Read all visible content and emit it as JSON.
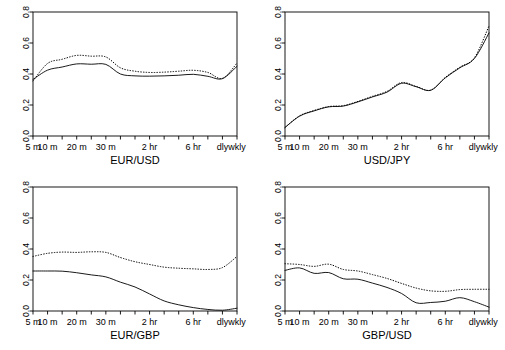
{
  "figure": {
    "layout": "2x2 grid of line panels",
    "background": "#ffffff",
    "line_color": "#000000",
    "axis_color": "#000000"
  },
  "axes": {
    "y_ticks": [
      "0.0",
      "0.2",
      "0.4",
      "0.6",
      "0.8"
    ],
    "y_values": [
      0.0,
      0.2,
      0.4,
      0.6,
      0.8
    ],
    "ylim": [
      0.0,
      0.8
    ],
    "x_tick_labels": [
      "5 m",
      "10 m",
      "20 m",
      "30 m",
      "2 hr",
      "6 hr",
      "dly",
      "wkly"
    ],
    "x_all_categories": [
      "5 m",
      "10 m",
      "15 m",
      "20 m",
      "25 m",
      "30 m",
      "45 m",
      "1 hr",
      "2 hr",
      "3 hr",
      "4 hr",
      "6 hr",
      "12 hr",
      "dly",
      "wkly"
    ],
    "grid": false,
    "legend": "none"
  },
  "chart_data": [
    {
      "type": "line",
      "title": "EUR/USD",
      "xlabel": "EUR/USD",
      "ylabel": "",
      "ylim": [
        0.0,
        0.8
      ],
      "categories": [
        "5 m",
        "10 m",
        "15 m",
        "20 m",
        "25 m",
        "30 m",
        "45 m",
        "1 hr",
        "2 hr",
        "3 hr",
        "4 hr",
        "6 hr",
        "12 hr",
        "dly",
        "wkly"
      ],
      "series": [
        {
          "name": "solid",
          "style": "solid",
          "values": [
            0.365,
            0.425,
            0.445,
            0.465,
            0.463,
            0.462,
            0.4,
            0.388,
            0.386,
            0.388,
            0.392,
            0.398,
            0.385,
            0.37,
            0.45
          ]
        },
        {
          "name": "dotted",
          "style": "dotted",
          "values": [
            0.355,
            0.468,
            0.495,
            0.52,
            0.515,
            0.51,
            0.44,
            0.418,
            0.41,
            0.412,
            0.418,
            0.424,
            0.41,
            0.372,
            0.47
          ]
        }
      ]
    },
    {
      "type": "line",
      "title": "USD/JPY",
      "xlabel": "USD/JPY",
      "ylabel": "",
      "ylim": [
        0.0,
        0.8
      ],
      "categories": [
        "5 m",
        "10 m",
        "15 m",
        "20 m",
        "25 m",
        "30 m",
        "45 m",
        "1 hr",
        "2 hr",
        "3 hr",
        "4 hr",
        "6 hr",
        "12 hr",
        "dly",
        "wkly"
      ],
      "series": [
        {
          "name": "solid",
          "style": "solid",
          "values": [
            0.055,
            0.128,
            0.162,
            0.188,
            0.193,
            0.22,
            0.252,
            0.283,
            0.34,
            0.318,
            0.295,
            0.375,
            0.44,
            0.5,
            0.665
          ]
        },
        {
          "name": "dotted",
          "style": "dotted",
          "values": [
            0.055,
            0.13,
            0.165,
            0.19,
            0.196,
            0.223,
            0.256,
            0.288,
            0.345,
            0.32,
            0.296,
            0.378,
            0.444,
            0.505,
            0.71
          ]
        }
      ]
    },
    {
      "type": "line",
      "title": "EUR/GBP",
      "xlabel": "EUR/GBP",
      "ylabel": "",
      "ylim": [
        0.0,
        0.8
      ],
      "categories": [
        "5 m",
        "10 m",
        "15 m",
        "20 m",
        "25 m",
        "30 m",
        "45 m",
        "1 hr",
        "2 hr",
        "3 hr",
        "4 hr",
        "6 hr",
        "12 hr",
        "dly",
        "wkly"
      ],
      "series": [
        {
          "name": "solid",
          "style": "solid",
          "values": [
            0.258,
            0.258,
            0.257,
            0.247,
            0.233,
            0.22,
            0.186,
            0.155,
            0.11,
            0.065,
            0.04,
            0.022,
            0.01,
            0.005,
            0.018
          ]
        },
        {
          "name": "dotted",
          "style": "dotted",
          "values": [
            0.352,
            0.372,
            0.38,
            0.378,
            0.382,
            0.378,
            0.345,
            0.318,
            0.3,
            0.283,
            0.276,
            0.272,
            0.268,
            0.28,
            0.352
          ]
        }
      ]
    },
    {
      "type": "line",
      "title": "GBP/USD",
      "xlabel": "GBP/USD",
      "ylabel": "",
      "ylim": [
        0.0,
        0.8
      ],
      "categories": [
        "5 m",
        "10 m",
        "15 m",
        "20 m",
        "25 m",
        "30 m",
        "45 m",
        "1 hr",
        "2 hr",
        "3 hr",
        "4 hr",
        "6 hr",
        "12 hr",
        "dly",
        "wkly"
      ],
      "series": [
        {
          "name": "solid",
          "style": "solid",
          "values": [
            0.262,
            0.278,
            0.243,
            0.248,
            0.208,
            0.205,
            0.18,
            0.152,
            0.113,
            0.053,
            0.055,
            0.063,
            0.086,
            0.06,
            0.025
          ]
        },
        {
          "name": "dotted",
          "style": "dotted",
          "values": [
            0.305,
            0.3,
            0.288,
            0.302,
            0.268,
            0.258,
            0.235,
            0.21,
            0.178,
            0.148,
            0.13,
            0.127,
            0.138,
            0.14,
            0.14
          ]
        }
      ]
    }
  ]
}
